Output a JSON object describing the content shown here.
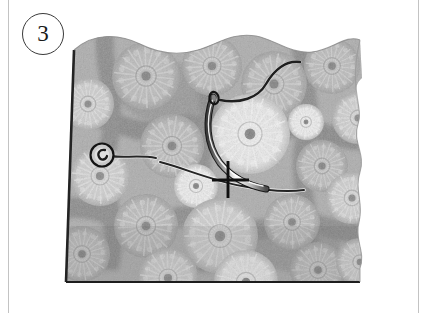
{
  "page": {
    "width": 433,
    "height": 313,
    "background_color": "#ffffff",
    "margin_rule_color": "#c3c3c3"
  },
  "step": {
    "number": "3",
    "badge_shape": "circle",
    "badge_border_color": "#3a3a3a",
    "text_color": "#1a1a1a"
  },
  "illustration": {
    "kind": "sewing-instruction-photo",
    "subject": "printed fabric swatch with curved needle and thread",
    "palette": {
      "fabric_base": "#a9a9a9",
      "fabric_shadow": "#7d7d7d",
      "fabric_highlight": "#d5d5d5",
      "flower_light": "#e8e8e8",
      "flower_white": "#f6f6f6",
      "flower_center": "#6a6a6a",
      "thread_dark": "#2b2b2b",
      "needle_metal": "#efefef",
      "needle_outline": "#1e1e1e",
      "edge_line": "#232323",
      "mark_color": "#141414"
    },
    "fabric": {
      "top_edge": "wavy",
      "right_edge": "wavy",
      "bottom_edge": "straight-dark-line",
      "left_edge": "straight-dark-line",
      "print_motif": "dandelion-chrysanthemum-rosettes",
      "motif_count": 21
    },
    "elements": [
      {
        "name": "thread-tail",
        "description": "dark thread entering from upper area and curving down to needle eye"
      },
      {
        "name": "curved-needle",
        "description": "shiny curved needle passing through fabric"
      },
      {
        "name": "thread-knot",
        "description": "small round knot / bead at left end of thread"
      },
      {
        "name": "stitch-mark",
        "description": "black cross mark showing where the needle should exit"
      }
    ]
  },
  "flowers": [
    {
      "cx": 28,
      "cy": 78,
      "r": 26,
      "tone": "light"
    },
    {
      "cx": 86,
      "cy": 50,
      "r": 34,
      "tone": "mid"
    },
    {
      "cx": 152,
      "cy": 40,
      "r": 30,
      "tone": "mid"
    },
    {
      "cx": 214,
      "cy": 58,
      "r": 33,
      "tone": "mid"
    },
    {
      "cx": 272,
      "cy": 40,
      "r": 28,
      "tone": "mid"
    },
    {
      "cx": 190,
      "cy": 108,
      "r": 40,
      "tone": "white"
    },
    {
      "cx": 112,
      "cy": 120,
      "r": 32,
      "tone": "mid"
    },
    {
      "cx": 40,
      "cy": 150,
      "r": 30,
      "tone": "light"
    },
    {
      "cx": 262,
      "cy": 140,
      "r": 26,
      "tone": "mid"
    },
    {
      "cx": 298,
      "cy": 92,
      "r": 26,
      "tone": "light"
    },
    {
      "cx": 136,
      "cy": 160,
      "r": 22,
      "tone": "white"
    },
    {
      "cx": 86,
      "cy": 200,
      "r": 32,
      "tone": "mid"
    },
    {
      "cx": 160,
      "cy": 210,
      "r": 38,
      "tone": "light"
    },
    {
      "cx": 232,
      "cy": 196,
      "r": 28,
      "tone": "mid"
    },
    {
      "cx": 292,
      "cy": 172,
      "r": 26,
      "tone": "light"
    },
    {
      "cx": 22,
      "cy": 228,
      "r": 28,
      "tone": "mid"
    },
    {
      "cx": 108,
      "cy": 252,
      "r": 30,
      "tone": "light"
    },
    {
      "cx": 186,
      "cy": 256,
      "r": 32,
      "tone": "white"
    },
    {
      "cx": 258,
      "cy": 244,
      "r": 28,
      "tone": "mid"
    },
    {
      "cx": 300,
      "cy": 236,
      "r": 24,
      "tone": "light"
    },
    {
      "cx": 246,
      "cy": 96,
      "r": 18,
      "tone": "white"
    }
  ]
}
